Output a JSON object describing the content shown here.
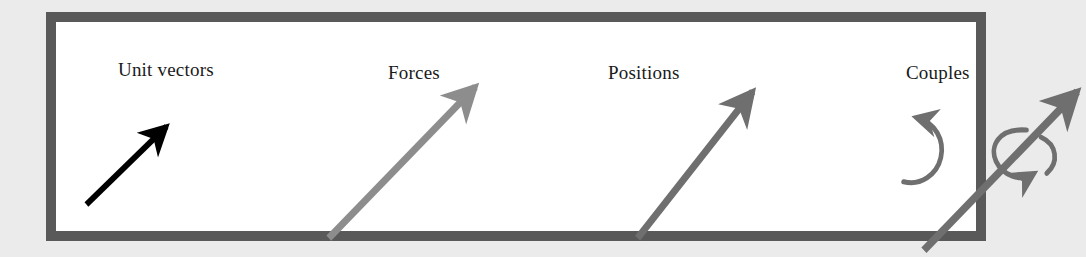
{
  "figure": {
    "background_color": "#ebebeb",
    "frame": {
      "border_color": "#595959",
      "fill_color": "#ffffff",
      "border_width_px": 10
    },
    "panels": [
      {
        "id": "unit-vectors",
        "label": "Unit vectors",
        "glyph": "straight-arrow",
        "arrow_color": "#000000",
        "arrow_description": "short thin black arrow pointing up and to the right"
      },
      {
        "id": "forces",
        "label": "Forces",
        "glyph": "straight-arrow",
        "arrow_color": "#8d8d8d",
        "arrow_description": "long thick medium-gray arrow pointing up and to the right"
      },
      {
        "id": "positions",
        "label": "Positions",
        "glyph": "straight-arrow",
        "arrow_color": "#6f6f6f",
        "arrow_description": "long thick dark-gray arrow pointing up and to the right"
      },
      {
        "id": "couples",
        "label": "Couples",
        "glyph": "circular-arrow-and-twisting-vector",
        "arrow_color": "#6f6f6f",
        "circular_arrow_color": "#6f6f6f",
        "twist_arrow_color": "#6f6f6f",
        "arrow_description": "counterclockwise circular arrow beside a gray straight arrow encircled by a curved twist arrow"
      }
    ]
  }
}
